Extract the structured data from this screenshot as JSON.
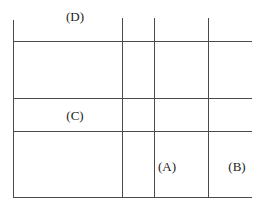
{
  "diagram": {
    "type": "grid-layout-sketch",
    "line_color": "#4a4a4a",
    "text_color": "#222222",
    "background": "#ffffff",
    "labels": {
      "A": "(A)",
      "B": "(B)",
      "C": "(C)",
      "D": "(D)"
    },
    "label_positions": {
      "D": {
        "x": 75,
        "y": 16
      },
      "C": {
        "x": 75,
        "y": 115
      },
      "A": {
        "x": 167,
        "y": 166
      },
      "B": {
        "x": 237,
        "y": 166
      }
    },
    "horizontal_lines": [
      {
        "y": 41,
        "x1": 13,
        "x2": 252
      },
      {
        "y": 98,
        "x1": 13,
        "x2": 252
      },
      {
        "y": 131,
        "x1": 13,
        "x2": 252
      },
      {
        "y": 197,
        "x1": 13,
        "x2": 252
      }
    ],
    "vertical_lines": [
      {
        "x": 13,
        "y1": 20,
        "y2": 197
      },
      {
        "x": 122,
        "y1": 18,
        "y2": 197
      },
      {
        "x": 154,
        "y1": 18,
        "y2": 197
      },
      {
        "x": 208,
        "y1": 18,
        "y2": 197
      }
    ]
  }
}
